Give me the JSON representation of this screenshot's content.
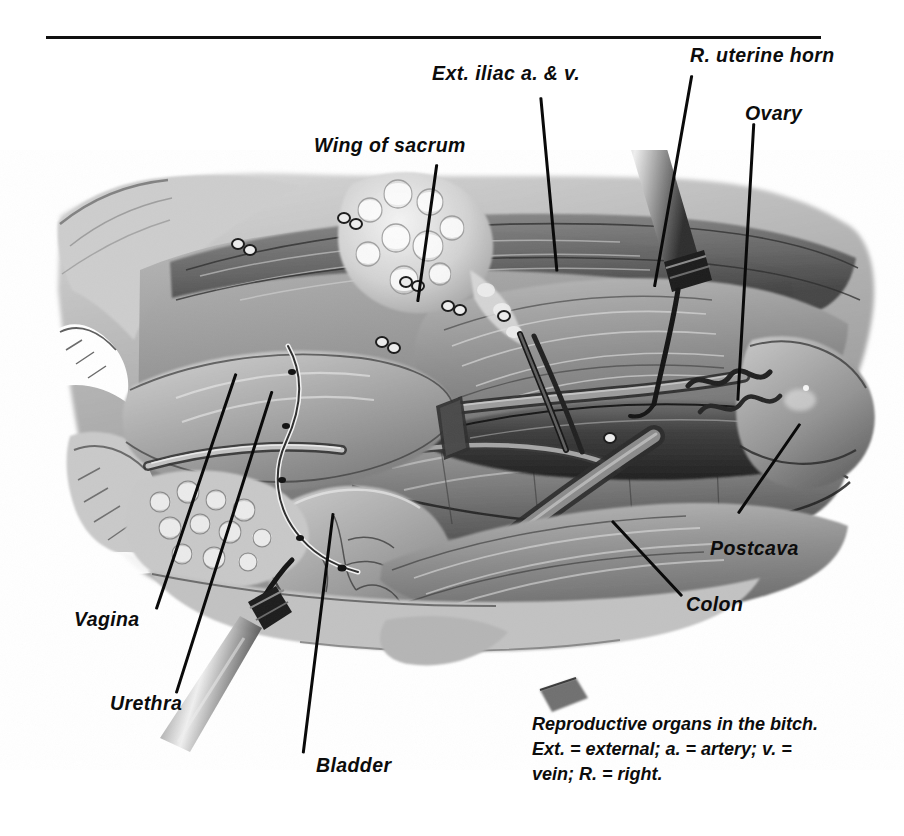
{
  "figure": {
    "kind": "anatomical-illustration",
    "subject": "Reproductive organs in the bitch",
    "rendering": "grayscale pencil / airbrush medical illustration",
    "background_color": "#ffffff",
    "ink_color": "#0c0c0c",
    "top_rule": {
      "present": true,
      "color": "#101010"
    }
  },
  "labels": [
    {
      "id": "ext-iliac",
      "text": "Ext. iliac a. & v."
    },
    {
      "id": "r-uterine-horn",
      "text": "R. uterine horn"
    },
    {
      "id": "ovary",
      "text": "Ovary"
    },
    {
      "id": "wing-of-sacrum",
      "text": "Wing of sacrum"
    },
    {
      "id": "postcava",
      "text": "Postcava"
    },
    {
      "id": "colon",
      "text": "Colon"
    },
    {
      "id": "vagina",
      "text": "Vagina"
    },
    {
      "id": "urethra",
      "text": "Urethra"
    },
    {
      "id": "bladder",
      "text": "Bladder"
    }
  ],
  "caption": {
    "line1": "Reproductive organs in the bitch.",
    "line2": "Ext. = external; a. = artery; v. =",
    "line3": "vein; R. = right."
  }
}
